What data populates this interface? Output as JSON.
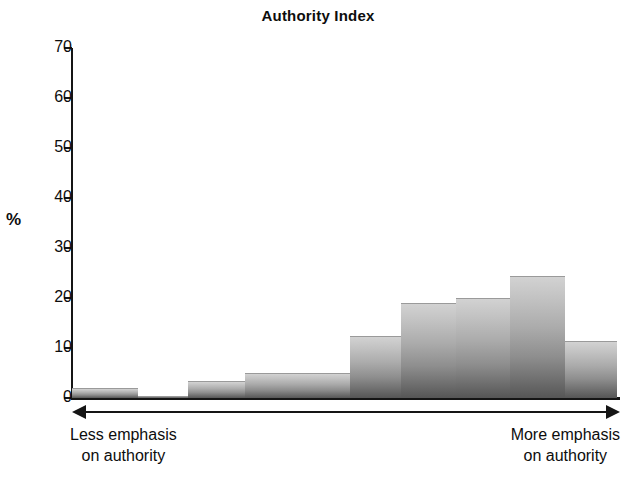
{
  "chart_data": {
    "type": "bar",
    "title": "Authority Index",
    "xlabel": "",
    "ylabel": "%",
    "ylim": [
      0,
      70
    ],
    "yticks": [
      0,
      10,
      20,
      30,
      40,
      50,
      60,
      70
    ],
    "ytick_labels": [
      "0",
      "10",
      "20",
      "30",
      "40",
      "50",
      "60",
      "70"
    ],
    "grid": false,
    "legend": "none",
    "categories": [
      "1",
      "2",
      "3",
      "4",
      "5",
      "6",
      "7",
      "8",
      "9"
    ],
    "values": [
      2,
      0.4,
      3.5,
      5,
      12.5,
      19,
      20,
      24.5,
      11.5
    ],
    "axis_annotation_left": "Less emphasis on authority",
    "axis_annotation_right": "More emphasis on authority",
    "note": "Histogram of an authority-emphasis index; bars are unlabeled categories along a low-to-high continuum."
  },
  "header": {
    "title": "Authority Index"
  },
  "y_axis": {
    "label": "%",
    "ticks": [
      {
        "value": 70,
        "label": "70"
      },
      {
        "value": 60,
        "label": "60"
      },
      {
        "value": 50,
        "label": "50"
      },
      {
        "value": 40,
        "label": "40"
      },
      {
        "value": 30,
        "label": "30"
      },
      {
        "value": 20,
        "label": "20"
      },
      {
        "value": 10,
        "label": "10"
      },
      {
        "value": 0,
        "label": "0"
      }
    ]
  },
  "x_axis": {
    "arrow": "double-headed-arrow",
    "left_caption_line1": "Less emphasis",
    "left_caption_line2": "on authority",
    "right_caption_line1": "More emphasis",
    "right_caption_line2": "on authority"
  },
  "bars": [
    {
      "name": "bar-1",
      "value": 2,
      "x": 72,
      "width": 66
    },
    {
      "name": "bar-2",
      "value": 0.4,
      "x": 138,
      "width": 50
    },
    {
      "name": "bar-3",
      "value": 3.5,
      "x": 188,
      "width": 57
    },
    {
      "name": "bar-4",
      "value": 5,
      "x": 245,
      "width": 105
    },
    {
      "name": "bar-5",
      "value": 12.5,
      "x": 350,
      "width": 51
    },
    {
      "name": "bar-6",
      "value": 19,
      "x": 401,
      "width": 55
    },
    {
      "name": "bar-7",
      "value": 20,
      "x": 456,
      "width": 54
    },
    {
      "name": "bar-8",
      "value": 24.5,
      "x": 510,
      "width": 55
    },
    {
      "name": "bar-9",
      "value": 11.5,
      "x": 565,
      "width": 52
    }
  ],
  "colors": {
    "axis": "#151515",
    "text": "#0d0d0d",
    "bar_top": "#d2d2d2",
    "bar_bottom": "#565656",
    "background": "#ffffff"
  }
}
